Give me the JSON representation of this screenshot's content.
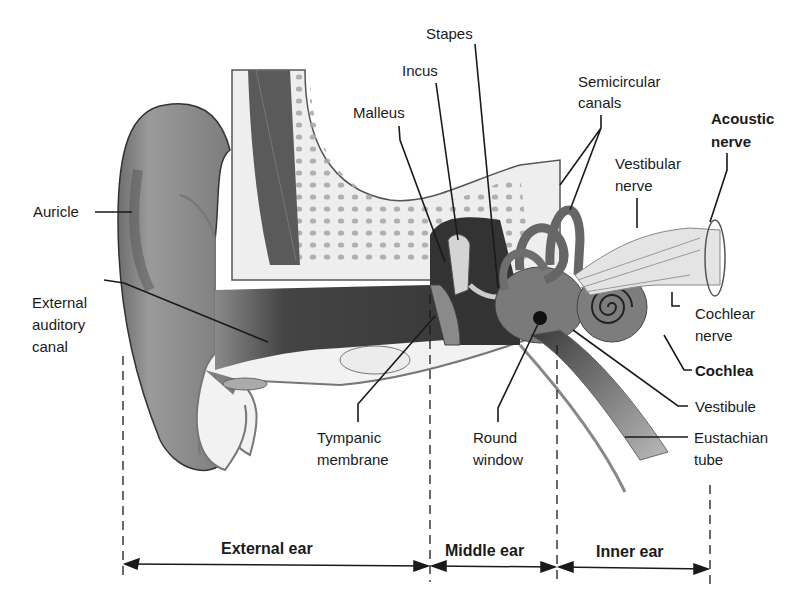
{
  "diagram": {
    "labels": {
      "stapes": "Stapes",
      "incus": "Incus",
      "malleus": "Malleus",
      "semicircular_1": "Semicircular",
      "semicircular_2": "canals",
      "acoustic_1": "Acoustic",
      "acoustic_2": "nerve",
      "vestibular_1": "Vestibular",
      "vestibular_2": "nerve",
      "auricle": "Auricle",
      "ext_canal_1": "External",
      "ext_canal_2": "auditory",
      "ext_canal_3": "canal",
      "cochlear_nerve_1": "Cochlear",
      "cochlear_nerve_2": "nerve",
      "cochlea": "Cochlea",
      "vestibule": "Vestibule",
      "eustachian_1": "Eustachian",
      "eustachian_2": "tube",
      "tympanic_1": "Tympanic",
      "tympanic_2": "membrane",
      "round_window_1": "Round",
      "round_window_2": "window"
    },
    "sections": {
      "external": "External ear",
      "middle": "Middle ear",
      "inner": "Inner ear"
    },
    "colors": {
      "skin_dark": "#5a5a5a",
      "skin_mid": "#8a8a8a",
      "skin_light": "#b5b5b5",
      "bone": "#efefef",
      "canal_dark": "#3c3c3c",
      "line": "#1a1a1a"
    }
  }
}
